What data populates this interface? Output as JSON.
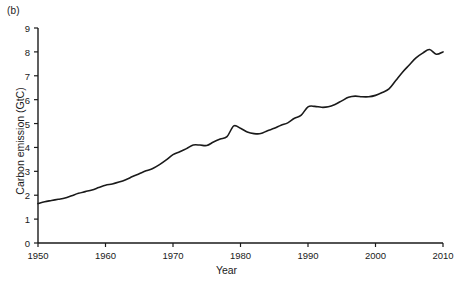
{
  "panel": {
    "label": "(b)"
  },
  "chart_data": {
    "type": "line",
    "title": "",
    "subtitle": "",
    "panel_label": "(b)",
    "xlabel": "Year",
    "ylabel": "Carbon emission (GtC)",
    "xlim": [
      1950,
      2010
    ],
    "ylim": [
      0,
      9
    ],
    "xticks": [
      1950,
      1960,
      1970,
      1980,
      1990,
      2000,
      2010
    ],
    "xticklabels": [
      "1950",
      "1960",
      "1970",
      "1980",
      "1990",
      "2000",
      "2010"
    ],
    "yticks": [
      0,
      1,
      2,
      3,
      4,
      5,
      6,
      7,
      8,
      9
    ],
    "yticklabels": [
      "0",
      "1",
      "2",
      "3",
      "4",
      "5",
      "6",
      "7",
      "8",
      "9"
    ],
    "grid": false,
    "legend": null,
    "legend_position": "none",
    "line_color": "#1a1a1a",
    "line_width": 1.6,
    "series": [
      {
        "name": "Global carbon emission",
        "units": "GtC",
        "x": [
          1950,
          1951,
          1952,
          1953,
          1954,
          1955,
          1956,
          1957,
          1958,
          1959,
          1960,
          1961,
          1962,
          1963,
          1964,
          1965,
          1966,
          1967,
          1968,
          1969,
          1970,
          1971,
          1972,
          1973,
          1974,
          1975,
          1976,
          1977,
          1978,
          1979,
          1980,
          1981,
          1982,
          1983,
          1984,
          1985,
          1986,
          1987,
          1988,
          1989,
          1990,
          1991,
          1992,
          1993,
          1994,
          1995,
          1996,
          1997,
          1998,
          1999,
          2000,
          2001,
          2002,
          2003,
          2004,
          2005,
          2006,
          2007,
          2008,
          2009,
          2010
        ],
        "values": [
          1.65,
          1.73,
          1.78,
          1.83,
          1.88,
          1.98,
          2.08,
          2.15,
          2.22,
          2.32,
          2.42,
          2.47,
          2.55,
          2.65,
          2.78,
          2.9,
          3.02,
          3.12,
          3.28,
          3.48,
          3.7,
          3.82,
          3.95,
          4.1,
          4.1,
          4.08,
          4.23,
          4.35,
          4.45,
          4.9,
          4.8,
          4.65,
          4.58,
          4.58,
          4.7,
          4.8,
          4.93,
          5.03,
          5.22,
          5.35,
          5.7,
          5.72,
          5.68,
          5.7,
          5.8,
          5.95,
          6.1,
          6.15,
          6.12,
          6.12,
          6.18,
          6.3,
          6.45,
          6.8,
          7.15,
          7.45,
          7.75,
          7.95,
          8.1,
          7.9,
          8.0
        ]
      }
    ]
  },
  "axes": {
    "plot_left_px": 38,
    "plot_right_px": 443,
    "plot_top_px": 28,
    "plot_bottom_px": 243
  }
}
